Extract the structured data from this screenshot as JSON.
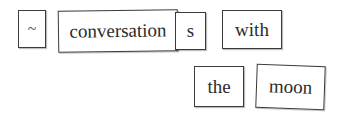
{
  "tiles": [
    {
      "text": "~"
    },
    {
      "text": "conversation"
    },
    {
      "text": "s"
    },
    {
      "text": "with"
    },
    {
      "text": "the"
    },
    {
      "text": "moon"
    }
  ]
}
